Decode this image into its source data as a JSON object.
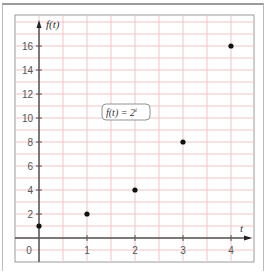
{
  "chart_data": {
    "type": "scatter",
    "title": "",
    "xlabel": "t",
    "ylabel": "f(t)",
    "annotation": "f(t) = 2^t",
    "annotation_display": {
      "base": "f(t) = 2",
      "exponent": "t"
    },
    "x": [
      0,
      1,
      2,
      3,
      4
    ],
    "values": [
      1,
      2,
      4,
      8,
      16
    ],
    "xlim": [
      -0.5,
      4.5
    ],
    "ylim": [
      -2,
      18
    ],
    "x_ticks": [
      0,
      1,
      2,
      3,
      4
    ],
    "x_tick_labels": [
      "0",
      "1",
      "2",
      "3",
      "4"
    ],
    "y_ticks": [
      2,
      4,
      6,
      8,
      10,
      12,
      14,
      16
    ],
    "y_tick_labels": [
      "2",
      "4",
      "6",
      "8",
      "10",
      "12",
      "14",
      "16"
    ],
    "grid": true,
    "grid_color": "#f2c4c4",
    "point_color": "#111111",
    "axis_color": "#555555",
    "legend": null
  }
}
